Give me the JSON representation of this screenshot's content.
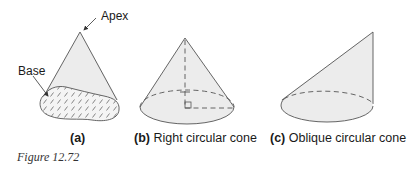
{
  "figure": {
    "number": "Figure 12.72",
    "colors": {
      "stroke": "#555555",
      "fill": "#ececec",
      "text": "#1a1a1a"
    }
  },
  "panels": [
    {
      "id": "a",
      "tag": "(a)",
      "title": "",
      "annotations": [
        {
          "text": "Apex",
          "target": "apex"
        },
        {
          "text": "Base",
          "target": "base"
        }
      ]
    },
    {
      "id": "b",
      "tag": "(b)",
      "title": "Right circular cone"
    },
    {
      "id": "c",
      "tag": "(c)",
      "title": "Oblique circular cone"
    }
  ]
}
